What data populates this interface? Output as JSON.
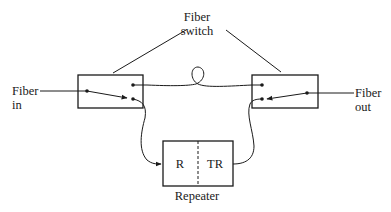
{
  "diagram": {
    "labels": {
      "fiber_switch_line1": "Fiber",
      "fiber_switch_line2": "switch",
      "fiber_in_line1": "Fiber",
      "fiber_in_line2": "in",
      "fiber_out_line1": "Fiber",
      "fiber_out_line2": "out",
      "receiver": "R",
      "transmitter": "TR",
      "repeater": "Repeater"
    },
    "colors": {
      "stroke": "#1a1a1a",
      "background": "#ffffff"
    }
  }
}
